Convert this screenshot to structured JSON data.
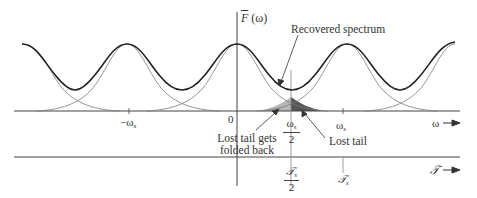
{
  "figure": {
    "y_axis_label": "F̄(ω)",
    "y_axis_label_main": "F",
    "y_axis_label_arg": "(ω)",
    "annotations": {
      "recovered_spectrum": "Recovered spectrum",
      "lost_tail_folded_line1": "Lost tail gets",
      "lost_tail_folded_line2": "folded back",
      "lost_tail": "Lost tail"
    },
    "omega_axis": {
      "label": "ω",
      "ticks": {
        "neg_ws": "−ω",
        "neg_ws_sub": "s",
        "zero": "0",
        "half_ws_num": "ω",
        "half_ws_num_sub": "s",
        "half_ws_den": "2",
        "ws": "ω",
        "ws_sub": "s"
      }
    },
    "F_axis": {
      "label": "𝒯",
      "ticks": {
        "half_Fs_num": "𝒯",
        "half_Fs_num_sub": "s",
        "half_Fs_den": "2",
        "Fs": "𝒯",
        "Fs_sub": "s"
      }
    },
    "colors": {
      "recovered_curve": "#222222",
      "component_curves": "#777777",
      "folded_tail_fill": "#b8b8b8",
      "lost_tail_fill": "#555555",
      "axis": "#444444"
    }
  }
}
